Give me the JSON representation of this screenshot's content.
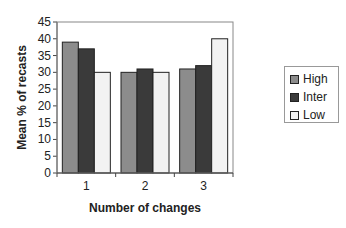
{
  "chart_data": {
    "type": "bar",
    "title": "",
    "xlabel": "Number of changes",
    "ylabel": "Mean % of recasts",
    "categories": [
      "1",
      "2",
      "3"
    ],
    "series": [
      {
        "name": "High",
        "values": [
          39,
          30,
          31
        ],
        "color": "#8c8c8c"
      },
      {
        "name": "Inter",
        "values": [
          37,
          31,
          32
        ],
        "color": "#3a3a3a"
      },
      {
        "name": "Low",
        "values": [
          30,
          30,
          40
        ],
        "color": "#f2f2f2"
      }
    ],
    "ylim": [
      0,
      45
    ],
    "yticks": [
      0,
      5,
      10,
      15,
      20,
      25,
      30,
      35,
      40,
      45
    ],
    "grid": false,
    "legend_position": "right"
  },
  "legend": {
    "items": [
      {
        "label": "High",
        "color": "#8c8c8c"
      },
      {
        "label": "Inter",
        "color": "#3a3a3a"
      },
      {
        "label": "Low",
        "color": "#f2f2f2"
      }
    ]
  }
}
